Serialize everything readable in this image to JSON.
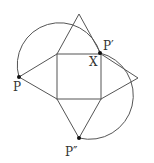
{
  "diagram": {
    "colors": {
      "stroke": "#555555",
      "point": "#111111",
      "label": "#333333",
      "background": "#ffffff"
    },
    "square": {
      "x": 57,
      "y": 54,
      "size": 44
    },
    "triangles": {
      "top": [
        [
          57,
          54
        ],
        [
          79,
          14
        ],
        [
          101,
          54
        ]
      ],
      "left": [
        [
          57,
          54
        ],
        [
          19,
          77
        ],
        [
          57,
          99
        ]
      ],
      "right": [
        [
          101,
          54
        ],
        [
          138,
          78
        ],
        [
          101,
          99
        ]
      ],
      "bottom": [
        [
          57,
          99
        ],
        [
          79,
          138
        ],
        [
          101,
          99
        ]
      ]
    },
    "arcs": {
      "upper_left": "M 19 77 A 38 38 0 1 1 100 53",
      "right": "M 100 53 A 42 42 0 1 1 79 138"
    },
    "points": {
      "P": {
        "x": 19,
        "y": 77,
        "label": "P",
        "label_x": 13,
        "label_y": 91
      },
      "P_prime": {
        "x": 100,
        "y": 53,
        "label": "P′",
        "label_x": 103,
        "label_y": 50
      },
      "X": {
        "label": "X",
        "label_x": 89,
        "label_y": 66
      },
      "P_double_prime": {
        "x": 79,
        "y": 138,
        "label": "P″",
        "label_x": 65,
        "label_y": 156
      }
    }
  }
}
